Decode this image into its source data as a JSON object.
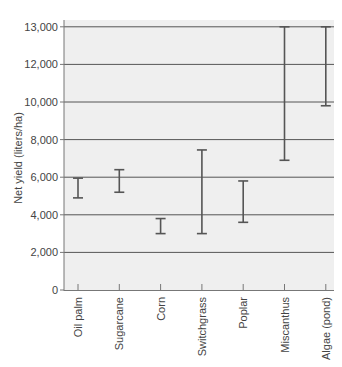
{
  "chart_data": {
    "type": "errorbar-range",
    "title": "",
    "xlabel": "",
    "ylabel": "Net yield (liters/ha)",
    "y_tick_labels": [
      "0",
      "2,000",
      "4,000",
      "6,000",
      "8,000",
      "10,000",
      "12,000",
      "13,000"
    ],
    "y_tick_positions": [
      0,
      2000,
      4000,
      6000,
      8000,
      10000,
      12000,
      14000
    ],
    "ylim": [
      0,
      14000
    ],
    "grid": true,
    "legend": null,
    "categories": [
      "Oil palm",
      "Sugarcane",
      "Corn",
      "Switchgrass",
      "Poplar",
      "Miscanthus",
      "Algae (pond)"
    ],
    "series": [
      {
        "name": "low",
        "values": [
          4900,
          5200,
          3000,
          3000,
          3600,
          6900,
          9800
        ]
      },
      {
        "name": "high",
        "values": [
          5950,
          6400,
          3800,
          7450,
          5800,
          14000,
          14000
        ]
      }
    ],
    "note": "Top gridline labeled 13,000 sits at the 14,000 spacing position; Miscanthus and Algae (pond) ranges extend to it."
  },
  "colors": {
    "plot_background": "#efefef",
    "gridline": "#555555",
    "errorbar": "#555555",
    "axis": "#777777"
  }
}
